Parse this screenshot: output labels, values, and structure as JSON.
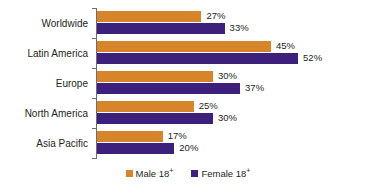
{
  "chart_data": {
    "type": "bar",
    "orientation": "horizontal",
    "title": "",
    "subtitle": "",
    "xlabel": "",
    "ylabel": "",
    "grid": false,
    "axis_line": true,
    "xlim": [
      0,
      60
    ],
    "value_suffix": "%",
    "legend_position": "bottom",
    "categories": [
      "Worldwide",
      "Latin America",
      "Europe",
      "North America",
      "Asia Pacific"
    ],
    "series": [
      {
        "name": "Male 18+",
        "name_base": "Male 18",
        "name_sup": "+",
        "color": "#d7852b",
        "values": [
          27,
          45,
          30,
          25,
          17
        ],
        "labels": [
          "27%",
          "45%",
          "30%",
          "25%",
          "17%"
        ]
      },
      {
        "name": "Female 18+",
        "name_base": "Female 18",
        "name_sup": "+",
        "color": "#3d1f7c",
        "values": [
          33,
          52,
          37,
          30,
          20
        ],
        "labels": [
          "33%",
          "52%",
          "37%",
          "30%",
          "20%"
        ]
      }
    ]
  },
  "colors": {
    "male": "#d7852b",
    "female": "#3d1f7c",
    "text": "#231f20",
    "axis": "#6e6e72",
    "background": "#ffffff"
  },
  "categories": {
    "0": "Worldwide",
    "1": "Latin America",
    "2": "Europe",
    "3": "North America",
    "4": "Asia Pacific"
  },
  "values": {
    "worldwide": {
      "male": "27%",
      "female": "33%"
    },
    "latin_america": {
      "male": "45%",
      "female": "52%"
    },
    "europe": {
      "male": "30%",
      "female": "37%"
    },
    "north_america": {
      "male": "25%",
      "female": "30%"
    },
    "asia_pacific": {
      "male": "17%",
      "female": "20%"
    }
  },
  "legend": {
    "male_base": "Male 18",
    "male_sup": "+",
    "female_base": "Female 18",
    "female_sup": "+"
  }
}
